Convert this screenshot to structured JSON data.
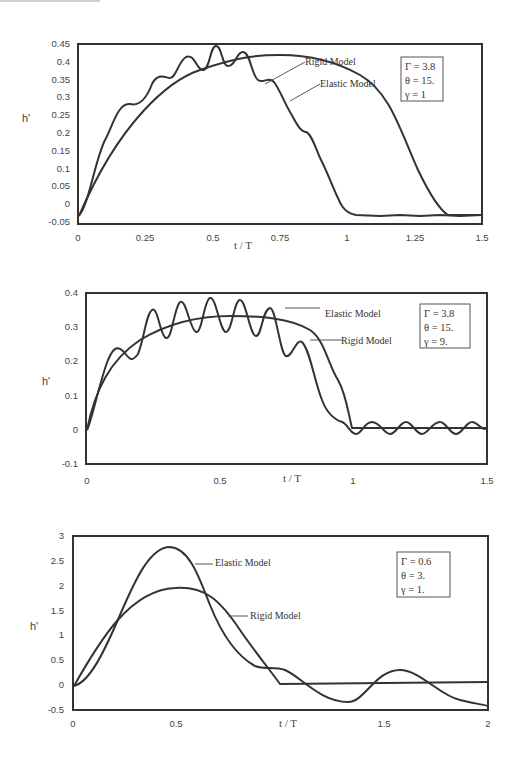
{
  "figure": {
    "charts": [
      {
        "y_label": "h'",
        "x_label": "t / T",
        "y_ticks": [
          "0.45",
          "0.4",
          "0.35",
          "0.3",
          "0.25",
          "0.2",
          "0.15",
          "0.1",
          "0.05",
          "0",
          "-0.05"
        ],
        "x_ticks": [
          "0",
          "0.25",
          "0.5",
          "0.75",
          "1",
          "1.25",
          "1.5"
        ],
        "annotations": {
          "rigid": "Rigid Model",
          "elastic": "Elastic Model"
        },
        "params": [
          "Γ = 3.8",
          "θ = 15.",
          "γ = 1"
        ]
      },
      {
        "y_label": "h'",
        "x_label": "t / T",
        "y_ticks": [
          "0.4",
          "0.3",
          "0.2",
          "0.1",
          "0",
          "-0.1"
        ],
        "x_ticks": [
          "0",
          "0.5",
          "1",
          "1.5"
        ],
        "annotations": {
          "rigid": "Rigid Model",
          "elastic": "Elastic Model"
        },
        "params": [
          "Γ = 3.8",
          "θ = 15.",
          "γ = 9."
        ]
      },
      {
        "y_label": "h'",
        "x_label": "t / T",
        "y_ticks": [
          "3",
          "2.5",
          "2",
          "1.5",
          "1",
          "0.5",
          "0",
          "-0.5"
        ],
        "x_ticks": [
          "0",
          "0.5",
          "1.5",
          "2"
        ],
        "annotations": {
          "rigid": "Rigid Model",
          "elastic": "Elastic Model"
        },
        "params": [
          "Γ = 0.6",
          "θ = 3.",
          "γ = 1."
        ]
      }
    ]
  },
  "chart_data": [
    {
      "type": "line",
      "title": "",
      "xlabel": "t / T",
      "ylabel": "h'",
      "xlim": [
        0,
        1.5
      ],
      "ylim": [
        -0.05,
        0.45
      ],
      "grid": false,
      "legend": {
        "position": "top-right box",
        "entries": [
          "Γ = 3.8",
          "θ = 15.",
          "γ = 1"
        ]
      },
      "annotations": [
        "Rigid Model",
        "Elastic Model"
      ],
      "x": [
        0,
        0.05,
        0.1,
        0.15,
        0.2,
        0.25,
        0.3,
        0.35,
        0.4,
        0.45,
        0.5,
        0.55,
        0.6,
        0.65,
        0.7,
        0.75,
        0.8,
        0.85,
        0.9,
        0.95,
        1.0,
        1.1,
        1.2,
        1.3,
        1.4,
        1.5
      ],
      "series": [
        {
          "name": "Rigid Model",
          "values": [
            0.0,
            0.08,
            0.15,
            0.21,
            0.26,
            0.3,
            0.335,
            0.36,
            0.38,
            0.39,
            0.395,
            0.39,
            0.38,
            0.36,
            0.335,
            0.3,
            0.26,
            0.21,
            0.15,
            0.08,
            0.0,
            0.0,
            0.0,
            0.0,
            0.0,
            0.0
          ]
        },
        {
          "name": "Elastic Model",
          "values": [
            0.0,
            0.06,
            0.18,
            0.185,
            0.27,
            0.31,
            0.305,
            0.39,
            0.36,
            0.36,
            0.42,
            0.365,
            0.365,
            0.395,
            0.31,
            0.32,
            0.25,
            0.19,
            0.18,
            0.08,
            0.005,
            0.0,
            0.003,
            0.0,
            0.003,
            0.002
          ]
        }
      ]
    },
    {
      "type": "line",
      "title": "",
      "xlabel": "t / T",
      "ylabel": "h'",
      "xlim": [
        0,
        1.5
      ],
      "ylim": [
        -0.1,
        0.4
      ],
      "grid": false,
      "legend": {
        "position": "top-right box",
        "entries": [
          "Γ = 3.8",
          "θ = 15.",
          "γ = 9."
        ]
      },
      "annotations": [
        "Elastic Model",
        "Rigid Model"
      ],
      "x": [
        0,
        0.05,
        0.1,
        0.15,
        0.2,
        0.25,
        0.3,
        0.35,
        0.4,
        0.45,
        0.5,
        0.55,
        0.6,
        0.65,
        0.7,
        0.75,
        0.8,
        0.85,
        0.9,
        0.95,
        1.0,
        1.05,
        1.1,
        1.2,
        1.3,
        1.4,
        1.5
      ],
      "series": [
        {
          "name": "Rigid Model",
          "values": [
            0.0,
            0.15,
            0.22,
            0.26,
            0.29,
            0.31,
            0.32,
            0.327,
            0.33,
            0.332,
            0.332,
            0.332,
            0.33,
            0.327,
            0.32,
            0.31,
            0.29,
            0.26,
            0.21,
            0.12,
            0.005,
            0.005,
            0.005,
            0.005,
            0.005,
            0.005,
            0.005
          ]
        },
        {
          "name": "Elastic Model",
          "values": [
            0.0,
            0.14,
            0.25,
            0.21,
            0.34,
            0.265,
            0.37,
            0.28,
            0.38,
            0.28,
            0.375,
            0.27,
            0.35,
            0.22,
            0.265,
            0.18,
            0.15,
            0.08,
            0.02,
            -0.01,
            0.02,
            -0.01,
            0.02,
            -0.01,
            0.02,
            -0.01,
            0.0
          ]
        }
      ]
    },
    {
      "type": "line",
      "title": "",
      "xlabel": "t / T",
      "ylabel": "h'",
      "xlim": [
        0,
        2
      ],
      "ylim": [
        -0.5,
        3
      ],
      "grid": false,
      "legend": {
        "position": "top-right box",
        "entries": [
          "Γ = 0.6",
          "θ = 3.",
          "γ = 1."
        ]
      },
      "annotations": [
        "Elastic Model",
        "Rigid Model"
      ],
      "x": [
        0,
        0.1,
        0.2,
        0.3,
        0.4,
        0.5,
        0.6,
        0.7,
        0.8,
        0.9,
        1.0,
        1.1,
        1.2,
        1.3,
        1.4,
        1.5,
        1.6,
        1.7,
        1.8,
        1.9,
        2.0
      ],
      "series": [
        {
          "name": "Rigid Model",
          "values": [
            0.0,
            0.65,
            1.2,
            1.6,
            1.9,
            1.97,
            1.9,
            1.6,
            1.2,
            0.65,
            0.0,
            0.0,
            0.0,
            0.0,
            0.0,
            0.0,
            0.0,
            0.0,
            0.0,
            0.0,
            0.0
          ]
        },
        {
          "name": "Elastic Model",
          "values": [
            0.0,
            0.2,
            0.85,
            1.85,
            2.6,
            2.75,
            2.2,
            1.3,
            0.65,
            0.35,
            0.3,
            0.05,
            -0.2,
            -0.3,
            -0.1,
            0.2,
            0.35,
            0.3,
            0.05,
            -0.2,
            -0.3
          ]
        }
      ]
    }
  ]
}
